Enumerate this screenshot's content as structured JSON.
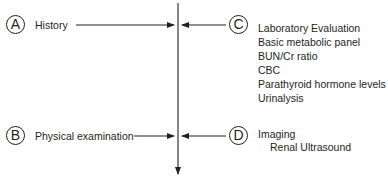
{
  "diagram": {
    "type": "convergent-flow",
    "nodes": {
      "A": {
        "letter": "A",
        "title": "History"
      },
      "B": {
        "letter": "B",
        "title": "Physical examination"
      },
      "C": {
        "letter": "C",
        "title": "Laboratory Evaluation",
        "items": [
          "Basic metabolic panel",
          "BUN/Cr ratio",
          "CBC",
          "Parathyroid hormone levels",
          "Urinalysis"
        ]
      },
      "D": {
        "letter": "D",
        "title": "Imaging",
        "items": [
          "Renal Ultrasound"
        ]
      }
    },
    "edges": [
      {
        "from": "A",
        "to": "main-axis"
      },
      {
        "from": "B",
        "to": "main-axis"
      },
      {
        "from": "C",
        "to": "main-axis"
      },
      {
        "from": "D",
        "to": "main-axis"
      },
      {
        "from": "main-axis",
        "to": "downstream"
      }
    ],
    "stroke_color": "#231f20"
  }
}
